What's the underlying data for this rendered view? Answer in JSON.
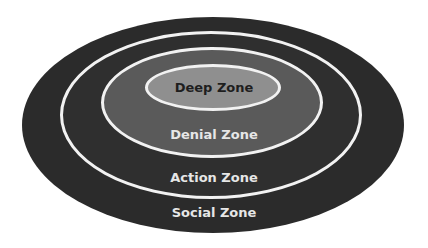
{
  "diagram": {
    "type": "concentric-ellipses",
    "zones": [
      {
        "label": "Social Zone",
        "fill": "#2b2b2b",
        "text_color": "#e6e6e6"
      },
      {
        "label": "Action Zone",
        "fill": "#2f2f2f",
        "text_color": "#e6e6e6"
      },
      {
        "label": "Denial Zone",
        "fill": "#5a5a5a",
        "text_color": "#e6e6e6"
      },
      {
        "label": "Deep Zone",
        "fill": "#8f8f8f",
        "text_color": "#1e1e1e"
      }
    ],
    "ring_stroke": "#f2f2f2"
  }
}
